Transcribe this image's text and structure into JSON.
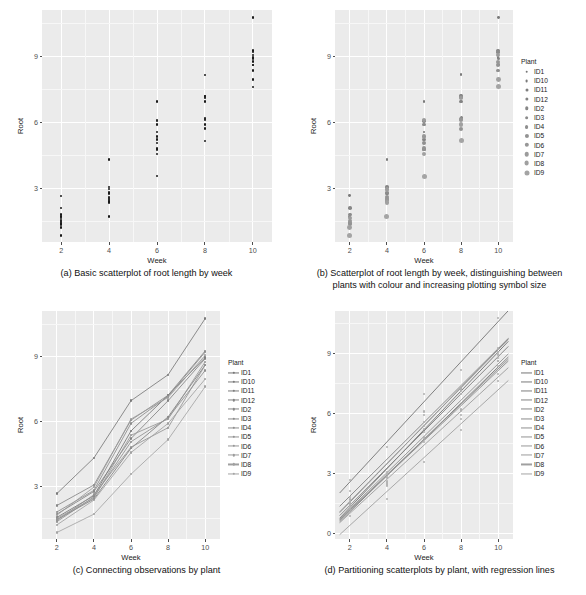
{
  "figure": {
    "panel_count": 4,
    "background": "#ffffff",
    "panel_fill": "#ebebeb",
    "gridline_color": "#ffffff",
    "point_color_mono": "#1a1a1a",
    "point_color_grey": "#8c8c8c",
    "line_color_grey": "#9a9a9a"
  },
  "captions": {
    "a": "(a) Basic scatterplot of root length by week",
    "b_line1": "(b) Scatterplot of root length by week, distinguishing between",
    "b_line2": "plants with colour and increasing plotting symbol size",
    "c": "(c) Connecting observations by plant",
    "d": "(d) Partitioning scatterplots by plant, with regression lines"
  },
  "axes": {
    "xlabel": "Week",
    "ylabel": "Root",
    "x_ticks": [
      "2",
      "4",
      "6",
      "8",
      "10"
    ],
    "x_values": [
      2,
      4,
      6,
      8,
      10
    ],
    "y_ticks_abc": [
      "3",
      "6",
      "9"
    ],
    "y_values_abc": [
      3,
      6,
      9
    ],
    "y_ticks_d": [
      "0",
      "3",
      "6",
      "9"
    ],
    "y_values_d": [
      0,
      3,
      6,
      9
    ],
    "xlim": [
      1.2,
      10.8
    ],
    "ylim_abc": [
      0.55,
      11.1
    ],
    "ylim_d": [
      -0.3,
      11.1
    ]
  },
  "legend": {
    "title": "Plant",
    "items": [
      "ID1",
      "ID10",
      "ID11",
      "ID12",
      "ID2",
      "ID3",
      "ID4",
      "ID5",
      "ID6",
      "ID7",
      "ID8",
      "ID9"
    ]
  },
  "chart_data": {
    "type": "scatter",
    "xlabel": "Week",
    "ylabel": "Root",
    "x": [
      2,
      4,
      6,
      8,
      10
    ],
    "xlim": [
      1.2,
      10.8
    ],
    "ylim": [
      0.55,
      11.1
    ],
    "grid": true,
    "legend_position": "right",
    "panels": [
      {
        "id": "a",
        "type": "scatter",
        "caption": "(a) Basic scatterplot of root length by week",
        "colour_by_plant": false,
        "size_by_plant": false,
        "ylim": [
          0.55,
          11.1
        ],
        "yticks": [
          3,
          6,
          9
        ]
      },
      {
        "id": "b",
        "type": "scatter",
        "caption": "(b) Scatterplot of root length by week, distinguishing between plants with colour and increasing plotting symbol size",
        "colour_by_plant": true,
        "size_by_plant": true,
        "ylim": [
          0.55,
          11.1
        ],
        "yticks": [
          3,
          6,
          9
        ]
      },
      {
        "id": "c",
        "type": "line",
        "caption": "(c) Connecting observations by plant",
        "colour_by_plant": true,
        "connect_points": true,
        "ylim": [
          0.55,
          11.1
        ],
        "yticks": [
          3,
          6,
          9
        ]
      },
      {
        "id": "d",
        "type": "scatter",
        "caption": "(d) Partitioning scatterplots by plant, with regression lines",
        "colour_by_plant": true,
        "regression_lines": true,
        "ylim": [
          -0.3,
          11.1
        ],
        "yticks": [
          0,
          3,
          6,
          9
        ]
      }
    ],
    "series": [
      {
        "name": "ID1",
        "values": [
          1.55,
          2.55,
          5.55,
          7.2,
          8.95
        ]
      },
      {
        "name": "ID10",
        "values": [
          2.65,
          4.3,
          6.95,
          8.15,
          10.75
        ]
      },
      {
        "name": "ID11",
        "values": [
          1.45,
          2.4,
          4.75,
          6.2,
          8.6
        ]
      },
      {
        "name": "ID12",
        "values": [
          1.7,
          2.75,
          5.2,
          6.95,
          8.9
        ]
      },
      {
        "name": "ID2",
        "values": [
          2.1,
          3.05,
          6.05,
          7.2,
          9.25
        ]
      },
      {
        "name": "ID3",
        "values": [
          1.8,
          2.8,
          5.9,
          7.15,
          9.2
        ]
      },
      {
        "name": "ID4",
        "values": [
          1.35,
          2.5,
          5.05,
          6.15,
          8.35
        ]
      },
      {
        "name": "ID5",
        "values": [
          1.4,
          2.6,
          4.8,
          5.7,
          8.6
        ]
      },
      {
        "name": "ID6",
        "values": [
          1.5,
          2.45,
          5.35,
          6.1,
          8.75
        ]
      },
      {
        "name": "ID7",
        "values": [
          1.65,
          2.95,
          6.1,
          7.1,
          9.05
        ]
      },
      {
        "name": "ID8",
        "values": [
          1.2,
          2.35,
          4.55,
          5.9,
          7.95
        ]
      },
      {
        "name": "ID9",
        "values": [
          0.85,
          1.7,
          3.55,
          5.15,
          7.6
        ]
      }
    ]
  }
}
